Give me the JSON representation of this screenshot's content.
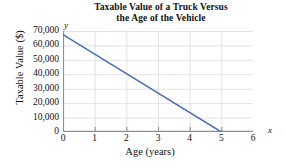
{
  "chart_data": {
    "type": "line",
    "title": "Taxable Value of a Truck Versus the Age of the Vehicle",
    "title_line1": "Taxable Value of a Truck Versus",
    "title_line2": "the Age of the Vehicle",
    "xlabel": "Age (years)",
    "ylabel": "Taxable Value ($)",
    "x_axis_letter": "x",
    "y_axis_letter": "y",
    "xlim": [
      0,
      6
    ],
    "ylim": [
      0,
      70000
    ],
    "grid": true,
    "legend": "none",
    "x_ticks": [
      "0",
      "1",
      "2",
      "3",
      "4",
      "5",
      "6"
    ],
    "x_tick_values": [
      0,
      1,
      2,
      3,
      4,
      5,
      6
    ],
    "y_ticks": [
      "0",
      "10,000",
      "20,000",
      "30,000",
      "40,000",
      "50,000",
      "60,000",
      "70,000"
    ],
    "y_tick_values": [
      0,
      10000,
      20000,
      30000,
      40000,
      50000,
      60000,
      70000
    ],
    "series": [
      {
        "name": "Taxable value",
        "x": [
          0,
          5
        ],
        "values": [
          67500,
          0
        ],
        "color": "#4a6fb5"
      }
    ]
  },
  "colors": {
    "line": "#4a6fb5",
    "grid": "#e2e2e2",
    "axis": "#8f8f8f",
    "text": "#111111",
    "background": "#ffffff"
  }
}
